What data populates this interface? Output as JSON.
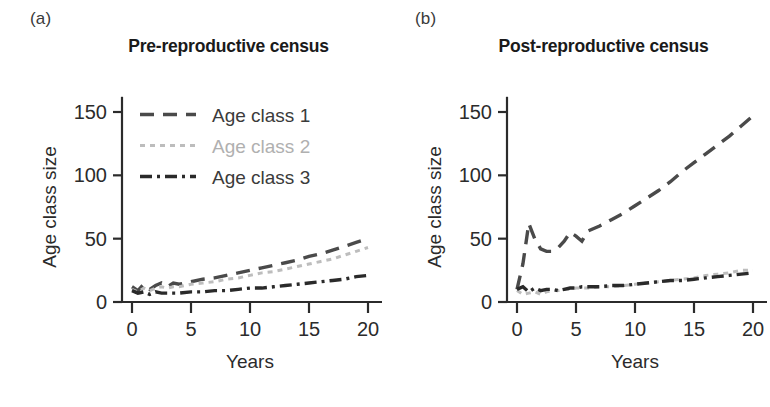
{
  "figure": {
    "background": "#ffffff",
    "text_color": "#231f20"
  },
  "panels": [
    {
      "letter": "(a)",
      "title": "Pre-reproductive census",
      "xlabel": "Years",
      "ylabel": "Age class size",
      "show_legend": true
    },
    {
      "letter": "(b)",
      "title": "Post-reproductive census",
      "xlabel": "Years",
      "ylabel": "Age class size",
      "show_legend": false
    }
  ],
  "legend": {
    "items": [
      {
        "label": "Age class 1",
        "color": "#4a4a4a",
        "dash": "14,9",
        "width": 3.4
      },
      {
        "label": "Age class 2",
        "color": "#bdbdbd",
        "dash": "5,5",
        "width": 3.0
      },
      {
        "label": "Age class 3",
        "color": "#2a2a2a",
        "dash": "12,5,3,5",
        "width": 3.4
      }
    ]
  },
  "axes": {
    "x_ticks": [
      0,
      5,
      10,
      15,
      20
    ],
    "y_ticks": [
      0,
      50,
      100,
      150
    ],
    "xlim": [
      0,
      20
    ],
    "ylim": [
      0,
      160
    ],
    "grid": false
  },
  "chart_data": [
    {
      "type": "line",
      "title": "Pre-reproductive census",
      "panel": "(a)",
      "xlabel": "Years",
      "ylabel": "Age class size",
      "xlim": [
        0,
        20
      ],
      "ylim": [
        0,
        160
      ],
      "x_ticks": [
        0,
        5,
        10,
        15,
        20
      ],
      "y_ticks": [
        0,
        50,
        100,
        150
      ],
      "grid": false,
      "legend_position": "top-left",
      "x": [
        0,
        0.5,
        1,
        1.5,
        2,
        2.5,
        3,
        3.5,
        4,
        5,
        6,
        7,
        8,
        9,
        10,
        11,
        12,
        13,
        14,
        15,
        16,
        17,
        18,
        19,
        20
      ],
      "series": [
        {
          "name": "Age class 1",
          "color": "#4a4a4a",
          "dash": "14,9",
          "values": [
            12,
            9,
            14,
            10,
            13,
            15,
            12,
            15,
            14,
            16,
            18,
            19,
            21,
            23,
            25,
            27,
            29,
            31,
            33,
            36,
            38,
            41,
            44,
            47,
            50
          ]
        },
        {
          "name": "Age class 2",
          "color": "#bdbdbd",
          "dash": "5,5",
          "values": [
            10,
            8,
            11,
            9,
            11,
            12,
            11,
            12,
            12,
            14,
            15,
            16,
            18,
            19,
            21,
            23,
            24,
            26,
            28,
            30,
            32,
            34,
            37,
            40,
            43
          ]
        },
        {
          "name": "Age class 3",
          "color": "#2a2a2a",
          "dash": "12,5,3,5",
          "values": [
            9,
            7,
            8,
            6,
            8,
            7,
            7,
            7,
            7,
            8,
            8,
            9,
            9,
            10,
            11,
            11,
            12,
            13,
            14,
            15,
            16,
            17,
            18,
            20,
            21
          ]
        }
      ]
    },
    {
      "type": "line",
      "title": "Post-reproductive census",
      "panel": "(b)",
      "xlabel": "Years",
      "ylabel": "Age class size",
      "xlim": [
        0,
        20
      ],
      "ylim": [
        0,
        160
      ],
      "x_ticks": [
        0,
        5,
        10,
        15,
        20
      ],
      "y_ticks": [
        0,
        50,
        100,
        150
      ],
      "grid": false,
      "legend_position": "none",
      "x": [
        0,
        0.5,
        1,
        1.5,
        2,
        2.5,
        3,
        3.5,
        4,
        4.5,
        5,
        5.5,
        6,
        7,
        8,
        9,
        10,
        11,
        12,
        13,
        14,
        15,
        16,
        17,
        18,
        19,
        20
      ],
      "series": [
        {
          "name": "Age class 1",
          "color": "#4a4a4a",
          "dash": "14,9",
          "values": [
            10,
            30,
            62,
            50,
            42,
            40,
            40,
            43,
            48,
            55,
            52,
            48,
            56,
            60,
            65,
            70,
            76,
            82,
            88,
            95,
            103,
            110,
            117,
            124,
            131,
            139,
            147
          ]
        },
        {
          "name": "Age class 2",
          "color": "#bdbdbd",
          "dash": "5,5",
          "values": [
            9,
            6,
            7,
            8,
            6,
            8,
            9,
            9,
            10,
            10,
            11,
            11,
            11,
            12,
            12,
            13,
            14,
            15,
            16,
            17,
            18,
            19,
            21,
            22,
            23,
            25,
            25
          ]
        },
        {
          "name": "Age class 3",
          "color": "#2a2a2a",
          "dash": "12,5,3,5",
          "values": [
            10,
            12,
            8,
            11,
            9,
            10,
            10,
            9,
            10,
            11,
            11,
            12,
            12,
            12,
            13,
            13,
            14,
            15,
            16,
            17,
            17,
            18,
            19,
            20,
            21,
            22,
            23
          ]
        }
      ]
    }
  ]
}
